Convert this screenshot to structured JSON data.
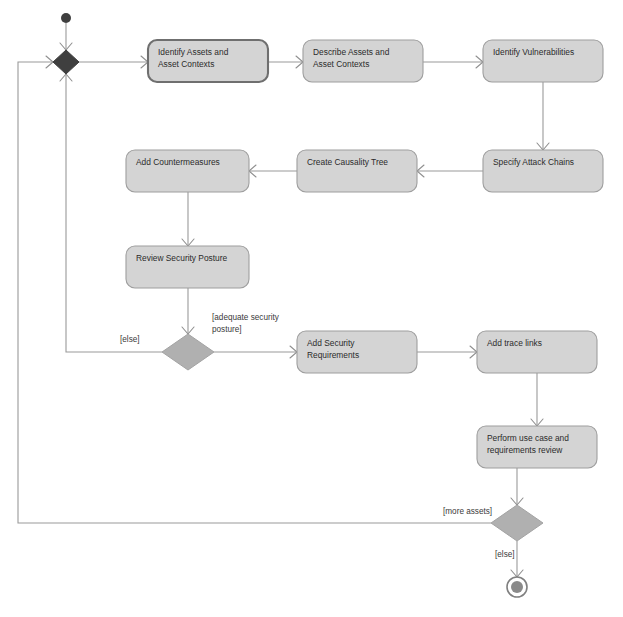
{
  "diagram": {
    "type": "uml-activity-diagram",
    "canvas": {
      "width": 623,
      "height": 617
    },
    "colors": {
      "action_fill": "#d4d4d4",
      "action_stroke": "#9e9e9e",
      "action_stroke_emphasis": "#6f6f6f",
      "decision_fill": "#b0b0b0",
      "merge_fill": "#3f3f3f",
      "flow_stroke": "#9a9a9a",
      "text": "#2b2b2b",
      "background": "#ffffff"
    },
    "nodes": {
      "initial": {
        "name": "initial-node",
        "cx": 66,
        "cy": 18,
        "r": 5
      },
      "merge": {
        "name": "merge-node",
        "cx": 66,
        "cy": 62,
        "rx": 13,
        "ry": 12
      },
      "actions": [
        {
          "id": "identify_assets",
          "label_lines": [
            "Identify Assets and",
            "Asset Contexts"
          ],
          "x": 148,
          "y": 40,
          "w": 120,
          "h": 42,
          "emphasis": true
        },
        {
          "id": "describe_assets",
          "label_lines": [
            "Describe Assets and",
            "Asset Contexts"
          ],
          "x": 303,
          "y": 40,
          "w": 120,
          "h": 42,
          "emphasis": false
        },
        {
          "id": "identify_vulnerabilities",
          "label_lines": [
            "Identify Vulnerabilities"
          ],
          "x": 483,
          "y": 40,
          "w": 120,
          "h": 42,
          "emphasis": false
        },
        {
          "id": "specify_attack_chains",
          "label_lines": [
            "Specify Attack Chains"
          ],
          "x": 483,
          "y": 150,
          "w": 120,
          "h": 42,
          "emphasis": false
        },
        {
          "id": "create_causality_tree",
          "label_lines": [
            "Create Causality Tree"
          ],
          "x": 297,
          "y": 150,
          "w": 120,
          "h": 42,
          "emphasis": false
        },
        {
          "id": "add_countermeasures",
          "label_lines": [
            "Add Countermeasures"
          ],
          "x": 126,
          "y": 150,
          "w": 123,
          "h": 42,
          "emphasis": false
        },
        {
          "id": "review_security_posture",
          "label_lines": [
            "Review Security Posture"
          ],
          "x": 126,
          "y": 246,
          "w": 123,
          "h": 42,
          "emphasis": false
        },
        {
          "id": "add_security_requirements",
          "label_lines": [
            "Add Security",
            "Requirements"
          ],
          "x": 297,
          "y": 331,
          "w": 120,
          "h": 42,
          "emphasis": false
        },
        {
          "id": "add_trace_links",
          "label_lines": [
            "Add trace links"
          ],
          "x": 477,
          "y": 331,
          "w": 120,
          "h": 42,
          "emphasis": false
        },
        {
          "id": "perform_review",
          "label_lines": [
            "Perform use case and",
            "requirements review"
          ],
          "x": 477,
          "y": 426,
          "w": 120,
          "h": 42,
          "emphasis": false
        }
      ],
      "decisions": [
        {
          "id": "posture_decision",
          "cx": 188,
          "cy": 352,
          "rx": 26,
          "ry": 18
        },
        {
          "id": "more_assets_decision",
          "cx": 517,
          "cy": 523,
          "rx": 26,
          "ry": 18
        }
      ],
      "final": {
        "name": "activity-final-node",
        "cx": 517,
        "cy": 587,
        "r_outer": 10,
        "r_inner": 6
      }
    },
    "guards": [
      {
        "id": "guard_else_posture",
        "text": "[else]",
        "x": 120,
        "y": 340
      },
      {
        "id": "guard_adequate_posture",
        "text_lines": [
          "[adequate security",
          "posture]"
        ],
        "x": 212,
        "y": 318
      },
      {
        "id": "guard_more_assets",
        "text": "[more assets]",
        "x": 443,
        "y": 512
      },
      {
        "id": "guard_else_final",
        "text": "[else]",
        "x": 495,
        "y": 555
      }
    ],
    "top_clipped_text": ""
  }
}
